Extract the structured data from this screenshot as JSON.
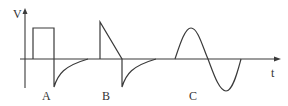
{
  "diagram": {
    "type": "waveform-diagram",
    "colors": {
      "stroke": "#3a3a3a",
      "text": "#333333",
      "background": "#ffffff"
    },
    "axes": {
      "y_label": "V",
      "x_label": "t"
    },
    "waveforms": [
      {
        "id": "A",
        "label": "A",
        "description": "square pulse followed by negative exponential spike decaying to zero"
      },
      {
        "id": "B",
        "label": "B",
        "description": "sawtooth (vertical rise, linear fall) followed by negative exponential spike decaying to zero"
      },
      {
        "id": "C",
        "label": "C",
        "description": "one full cycle of a sine wave"
      }
    ]
  }
}
